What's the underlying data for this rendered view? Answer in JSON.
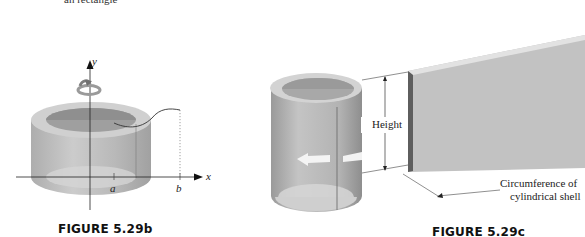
{
  "top_fragment": "an rectangle",
  "figure_b": {
    "caption": "FIGURE 5.29b",
    "axis_labels": {
      "y": "y",
      "x": "x",
      "a": "a",
      "b": "b"
    }
  },
  "figure_c": {
    "caption": "FIGURE 5.29c",
    "height_label": "Height",
    "circumference_label_line1": "Circumference of",
    "circumference_label_line2": "cylindrical shell"
  }
}
